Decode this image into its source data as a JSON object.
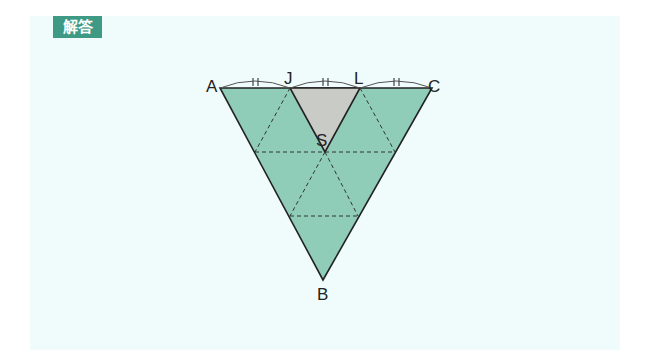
{
  "badge": {
    "label": "解答"
  },
  "diagram": {
    "points": {
      "A": {
        "label": "A",
        "x": 220,
        "y": 88
      },
      "J": {
        "label": "J",
        "x": 290,
        "y": 88
      },
      "L": {
        "label": "L",
        "x": 360,
        "y": 88
      },
      "C": {
        "label": "C",
        "x": 432,
        "y": 88
      },
      "S": {
        "label": "S",
        "x": 325,
        "y": 152
      },
      "B": {
        "label": "B",
        "x": 323,
        "y": 280
      }
    },
    "tick_mark": "=",
    "colors": {
      "fill_main": "#8fcdb9",
      "fill_shaded": "#c9cbc7",
      "stroke": "#222222",
      "panel": "#f0fbfb",
      "badge": "#3e9a84"
    }
  }
}
